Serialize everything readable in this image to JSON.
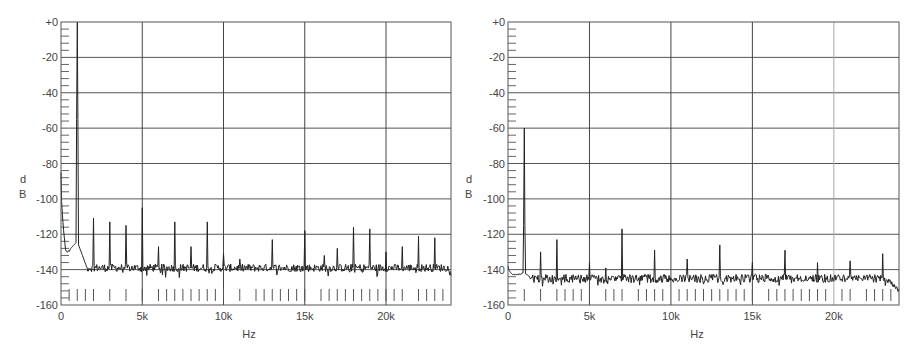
{
  "chart_data": [
    {
      "type": "line",
      "title": "",
      "xlabel": "Hz",
      "ylabel": "dB",
      "ylabel_chars": [
        "d",
        "B"
      ],
      "xlim": [
        0,
        24000
      ],
      "ylim": [
        -160,
        0
      ],
      "x_ticks": [
        0,
        5000,
        10000,
        15000,
        20000
      ],
      "x_tick_labels": [
        "0",
        "5k",
        "10k",
        "15k",
        "20k"
      ],
      "y_ticks": [
        0,
        -20,
        -40,
        -60,
        -80,
        -100,
        -120,
        -140,
        -160
      ],
      "y_tick_labels": [
        "+0",
        "-20",
        "-40",
        "-60",
        "-80",
        "-100",
        "-120",
        "-140",
        "-160"
      ],
      "grid": true,
      "light_gridlines_hz": [],
      "noise_floor_db": -139,
      "noise_amplitude_db": 2.2,
      "dc_rise": {
        "start_db": -85,
        "end_db": -130,
        "until_hz": 300
      },
      "fundamental": {
        "hz": 1000,
        "db": 0,
        "skirt_db": -124
      },
      "peaks": [
        {
          "hz": 2000,
          "db": -111
        },
        {
          "hz": 3000,
          "db": -113
        },
        {
          "hz": 4000,
          "db": -115
        },
        {
          "hz": 5000,
          "db": -105
        },
        {
          "hz": 6000,
          "db": -127
        },
        {
          "hz": 7000,
          "db": -113
        },
        {
          "hz": 8000,
          "db": -127
        },
        {
          "hz": 9000,
          "db": -113
        },
        {
          "hz": 10000,
          "db": -131
        },
        {
          "hz": 11000,
          "db": -134
        },
        {
          "hz": 13000,
          "db": -123
        },
        {
          "hz": 15000,
          "db": -118
        },
        {
          "hz": 16200,
          "db": -132
        },
        {
          "hz": 17000,
          "db": -128
        },
        {
          "hz": 18000,
          "db": -116
        },
        {
          "hz": 19000,
          "db": -117
        },
        {
          "hz": 20000,
          "db": -130
        },
        {
          "hz": 21000,
          "db": -127
        },
        {
          "hz": 22000,
          "db": -121
        },
        {
          "hz": 23000,
          "db": -122
        }
      ],
      "marker_ticks_hz": [
        500,
        1000,
        1500,
        2000,
        3000,
        4000,
        5000,
        6000,
        6500,
        7000,
        7500,
        8000,
        8500,
        9000,
        9500,
        10000,
        11000,
        12000,
        12500,
        13000,
        13500,
        14000,
        14500,
        15000,
        16000,
        16500,
        17000,
        17500,
        18000,
        18500,
        19000,
        19500,
        20000,
        20500,
        21000,
        22000,
        22500,
        23000,
        23500
      ]
    },
    {
      "type": "line",
      "title": "",
      "xlabel": "Hz",
      "ylabel": "dB",
      "ylabel_chars": [
        "d",
        "B"
      ],
      "xlim": [
        0,
        24000
      ],
      "ylim": [
        -160,
        0
      ],
      "x_ticks": [
        0,
        5000,
        10000,
        15000,
        20000
      ],
      "x_tick_labels": [
        "0",
        "5k",
        "10k",
        "15k",
        "20k"
      ],
      "y_ticks": [
        0,
        -20,
        -40,
        -60,
        -80,
        -100,
        -120,
        -140,
        -160
      ],
      "y_tick_labels": [
        "+0",
        "-20",
        "-40",
        "-60",
        "-80",
        "-100",
        "-120",
        "-140",
        "-160"
      ],
      "grid": true,
      "light_gridlines_hz": [
        20000
      ],
      "noise_floor_db": -145,
      "noise_amplitude_db": 2.4,
      "dc_rise": {
        "start_db": -138,
        "end_db": -143,
        "until_hz": 300
      },
      "fundamental": {
        "hz": 1000,
        "db": -60,
        "skirt_db": -142
      },
      "tail_rolloff": {
        "from_hz": 23200,
        "end_db": -152
      },
      "peaks": [
        {
          "hz": 2000,
          "db": -130
        },
        {
          "hz": 3000,
          "db": -123
        },
        {
          "hz": 5000,
          "db": -136
        },
        {
          "hz": 6000,
          "db": -139
        },
        {
          "hz": 7000,
          "db": -117
        },
        {
          "hz": 9000,
          "db": -129
        },
        {
          "hz": 11000,
          "db": -134
        },
        {
          "hz": 13000,
          "db": -126
        },
        {
          "hz": 15000,
          "db": -136
        },
        {
          "hz": 17000,
          "db": -129
        },
        {
          "hz": 19000,
          "db": -136
        },
        {
          "hz": 21000,
          "db": -135
        },
        {
          "hz": 23000,
          "db": -131
        }
      ],
      "marker_ticks_hz": [
        1000,
        2000,
        3000,
        3500,
        4000,
        4500,
        5000,
        6000,
        6500,
        7000,
        8000,
        8500,
        9000,
        9500,
        10500,
        11000,
        11500,
        12000,
        12500,
        13000,
        13500,
        14000,
        14500,
        15000,
        16000,
        16500,
        17000,
        17500,
        18000,
        18500,
        19000,
        19500,
        20500,
        21000,
        22000,
        22500,
        23000,
        23500
      ]
    }
  ]
}
